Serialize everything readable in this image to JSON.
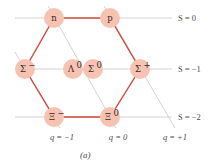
{
  "diagram": {
    "caption": "(a)",
    "colors": {
      "node_fill": "#f6c3b3",
      "hexagon_edge": "#d2493a",
      "grid_line": "#c8c8c8",
      "text": "#3a2a24"
    },
    "nodes": [
      {
        "id": "n",
        "base": "n",
        "sup": "",
        "x": 54,
        "y": 18
      },
      {
        "id": "p",
        "base": "p",
        "sup": "",
        "x": 110,
        "y": 18
      },
      {
        "id": "sigma-minus",
        "base": "Σ",
        "sup": "−",
        "x": 25,
        "y": 69
      },
      {
        "id": "lambda-0",
        "base": "Λ",
        "sup": "0",
        "x": 73,
        "y": 69
      },
      {
        "id": "sigma-0",
        "base": "Σ",
        "sup": "0",
        "x": 93,
        "y": 69
      },
      {
        "id": "sigma-plus",
        "base": "Σ",
        "sup": "+",
        "x": 140,
        "y": 69
      },
      {
        "id": "xi-minus",
        "base": "Ξ",
        "sup": "−",
        "x": 54,
        "y": 117
      },
      {
        "id": "xi-0",
        "base": "Ξ",
        "sup": "0",
        "x": 110,
        "y": 117
      }
    ],
    "strangeness_labels": [
      {
        "text": "S = 0",
        "y": 18
      },
      {
        "text": "S = −1",
        "y": 69
      },
      {
        "text": "S = −2",
        "y": 117
      }
    ],
    "charge_labels": [
      {
        "text": "q = −1",
        "x": 62
      },
      {
        "text": "q = 0",
        "x": 118
      },
      {
        "text": "q = +1",
        "x": 175
      }
    ]
  }
}
